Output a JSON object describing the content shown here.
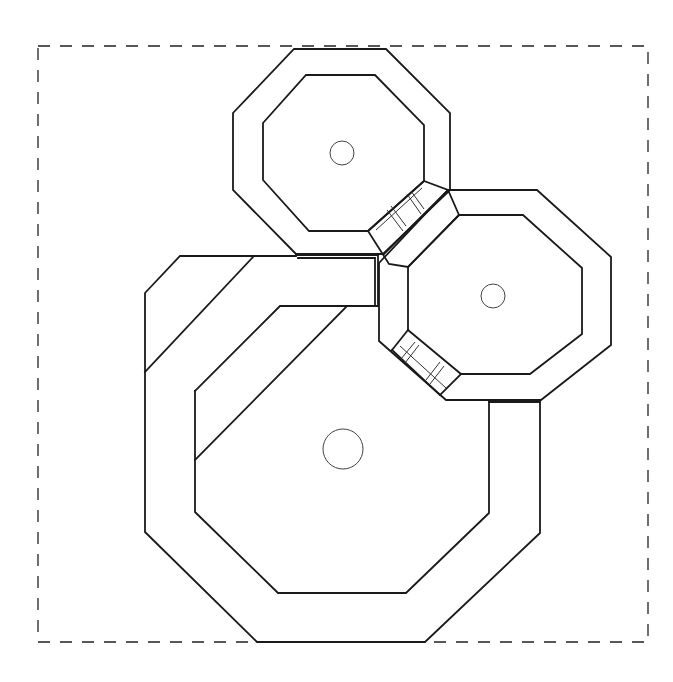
{
  "diagram": {
    "type": "architectural-floor-plan",
    "colors": {
      "line": "#1a1a1a",
      "background": "#ffffff"
    },
    "boundary": {
      "style": "dashed",
      "x": 38,
      "y": 46,
      "width": 610,
      "height": 596
    },
    "rooms": [
      {
        "id": "top-octagon",
        "label": "Small octagonal room (top)",
        "center_column": {
          "cx": 342,
          "cy": 153,
          "r": 12
        }
      },
      {
        "id": "right-octagon",
        "label": "Small octagonal room (right)",
        "center_column": {
          "cx": 493,
          "cy": 296,
          "r": 12
        }
      },
      {
        "id": "large-octagon",
        "label": "Large octagonal room (bottom-left)",
        "center_column": {
          "cx": 343,
          "cy": 449,
          "r": 20
        }
      }
    ],
    "connectors": [
      {
        "id": "passage-top-right",
        "label": "Stepped passage between top and right octagons"
      },
      {
        "id": "passage-right-inner",
        "label": "Stepped passage inside right octagon (lower-left)"
      },
      {
        "id": "corridor-top",
        "label": "Corridor linking large room to top octagon"
      },
      {
        "id": "corridor-right",
        "label": "Corridor linking large room to right octagon"
      }
    ]
  }
}
